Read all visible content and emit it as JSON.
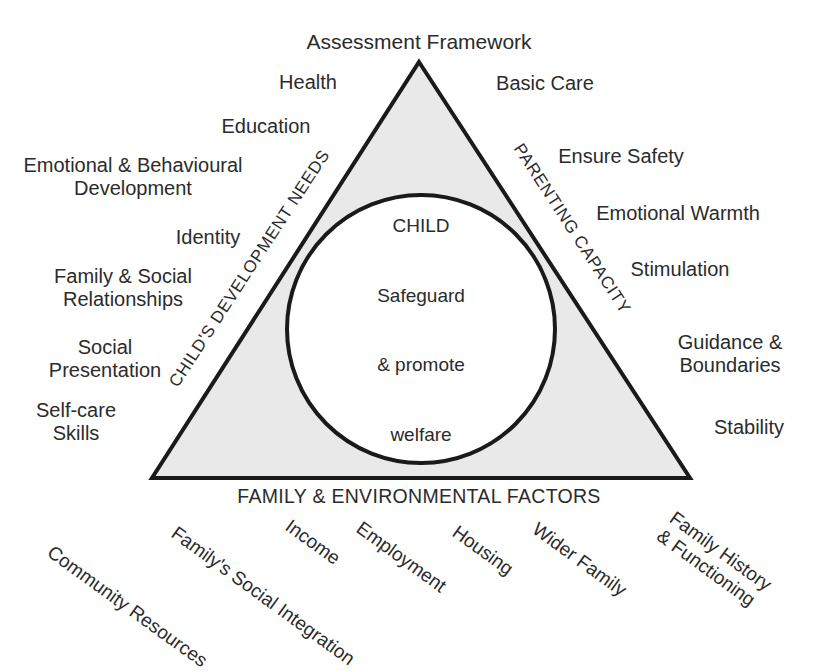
{
  "diagram": {
    "title": "Assessment Framework",
    "core": {
      "line1": "CHILD",
      "line2": "Safeguard",
      "line3": "& promote",
      "line4": "welfare"
    },
    "sides": {
      "left_axis": "CHILD'S DEVELOPMENT NEEDS",
      "right_axis": "PARENTING CAPACITY",
      "bottom_axis": "FAMILY & ENVIRONMENTAL FACTORS"
    },
    "childs_development_needs": [
      "Health",
      "Education",
      "Emotional & Behavioural\nDevelopment",
      "Identity",
      "Family & Social\nRelationships",
      "Social\nPresentation",
      "Self-care\nSkills"
    ],
    "parenting_capacity": [
      "Basic Care",
      "Ensure Safety",
      "Emotional Warmth",
      "Stimulation",
      "Guidance &\nBoundaries",
      "Stability"
    ],
    "family_and_environmental_factors": [
      "Community Resources",
      "Family's Social Integration",
      "Income",
      "Employment",
      "Housing",
      "Wider Family",
      "Family History\n& Functioning"
    ],
    "colors": {
      "triangle_fill": "#e9e9e9",
      "outline": "#1a1a1a",
      "text": "#2b2b2b",
      "background": "#ffffff"
    }
  }
}
